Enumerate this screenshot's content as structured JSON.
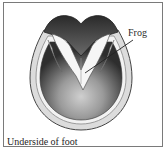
{
  "figure": {
    "caption": "Underside of foot",
    "labels": [
      {
        "text": "Frog",
        "target": "frog"
      }
    ]
  },
  "colors": {
    "border": "#7a7a7a",
    "wall": "#d9d9d9",
    "sole_dark": "#3c3c3c",
    "sole_light": "#bdbdbd",
    "frog": "#f4f4f4",
    "text": "#222222"
  }
}
